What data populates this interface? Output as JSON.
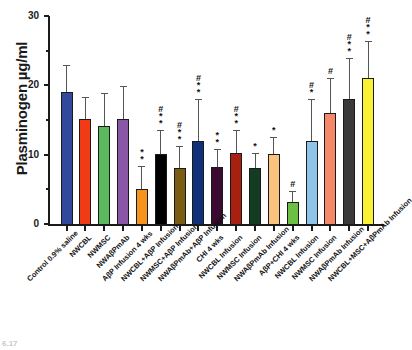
{
  "chart_data": {
    "type": "bar",
    "title": "",
    "xlabel": "",
    "ylabel": "Plasminogen µg/ml",
    "ylim": [
      0,
      30
    ],
    "yticks": [
      0,
      10,
      20,
      30
    ],
    "ytick_labels": [
      "0",
      "10",
      "20",
      "30"
    ],
    "grid": false,
    "legend": "none",
    "categories": [
      "Control 0.9% saline",
      "NWCBL",
      "NWMSC",
      "NWAβPmAb",
      "AβP Infusion 4 wks",
      "NWCBL+AβP Infusion",
      "NWMSC+AβP Infusion",
      "NWAβPmAb+AβP Infusion",
      "CHI 4 wks",
      "NWCBL Infusion",
      "NWMSC Infusion",
      "NWAβPmAb Infusion",
      "AβP+CHI 4 wks",
      "NWCBL Infusion",
      "NWMSC Infusion",
      "NWAβPmAb Infusion",
      "NWCBL+MSC+AβPmAb Infusion"
    ],
    "values": [
      19,
      15.2,
      14.2,
      15.2,
      5.1,
      10.1,
      8.1,
      12.0,
      8.2,
      10.2,
      8.1,
      10.1,
      3.2,
      12.0,
      16.0,
      18.0,
      21.0
    ],
    "errors": [
      4.0,
      3.1,
      4.7,
      4.7,
      3.2,
      3.4,
      3.1,
      6.0,
      2.6,
      3.3,
      2.1,
      2.5,
      1.6,
      6.0,
      5.0,
      6.0,
      5.4
    ],
    "bar_colors": [
      "#2f4a9c",
      "#f03b16",
      "#5cb85c",
      "#8a57a8",
      "#f7941e",
      "#000000",
      "#7a5c12",
      "#10307a",
      "#3b0a30",
      "#a82010",
      "#123d22",
      "#fac47f",
      "#6cbe45",
      "#8ec4e8",
      "#f58868",
      "#3a3a3a",
      "#f9f135"
    ],
    "significance": [
      "",
      "",
      "",
      "",
      "*\n*",
      "#\n*\n*",
      "#\n*\n*",
      "#\n*\n*",
      "*\n*",
      "#\n*\n*",
      "*",
      "*",
      "#",
      "#\n*",
      "#",
      "#\n*\n*",
      "#\n*\n*"
    ],
    "bar_count": 17,
    "axis_color": "#1a1a1a"
  },
  "corner_note": "6.17"
}
